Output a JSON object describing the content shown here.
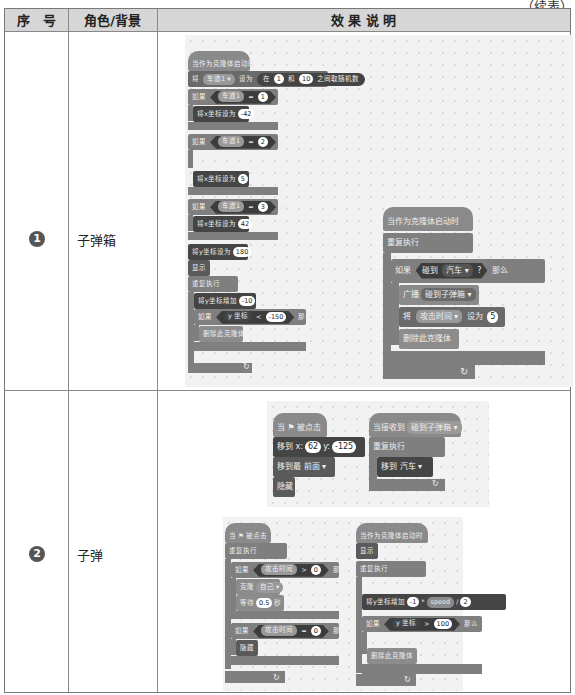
{
  "page": {
    "continued_label": "（续表）"
  },
  "table": {
    "headers": [
      "序　号",
      "角色/背景",
      "效 果 说 明"
    ],
    "rows": [
      {
        "number": "1",
        "role": "子弹箱",
        "scripts": [
          {
            "hat": "当作为克隆体启动时",
            "blocks": [
              {
                "text_parts": [
                  "将",
                  "车道1 ▾",
                  "设为",
                  "在",
                  "1",
                  "和",
                  "10",
                  "之间取随机数"
                ]
              },
              {
                "if": [
                  "如果",
                  "车道1",
                  "=",
                  "1",
                  "那么"
                ],
                "body": [
                  "将x坐标设为",
                  "-42"
                ]
              },
              {
                "if": [
                  "如果",
                  "车道1",
                  "=",
                  "2",
                  "那么"
                ],
                "body": [
                  "将x坐标设为",
                  "5"
                ]
              },
              {
                "if": [
                  "如果",
                  "车道1",
                  "=",
                  "3",
                  "那么"
                ],
                "body": [
                  "将x坐标设为",
                  "42"
                ]
              },
              {
                "text_parts": [
                  "将y坐标设为",
                  "180"
                ]
              },
              {
                "text_parts": [
                  "显示"
                ]
              },
              {
                "loop": "重复执行",
                "body": [
                  {
                    "text_parts": [
                      "将y坐标增加",
                      "-10"
                    ]
                  },
                  {
                    "if": [
                      "如果",
                      "y 坐标",
                      "<",
                      "-150",
                      "那么"
                    ],
                    "body": [
                      "删除此克隆体"
                    ]
                  }
                ]
              }
            ]
          },
          {
            "hat": "当作为克隆体启动时",
            "loop": "重复执行",
            "if": [
              "如果",
              "碰到",
              "汽车 ▾",
              "?",
              "那么"
            ],
            "body": [
              {
                "text_parts": [
                  "广播",
                  "碰到子弹箱 ▾"
                ]
              },
              {
                "text_parts": [
                  "将",
                  "攻击时间 ▾",
                  "设为",
                  "5"
                ]
              },
              {
                "text_parts": [
                  "删除此克隆体"
                ]
              }
            ]
          }
        ]
      },
      {
        "number": "2",
        "role": "子弹",
        "scripts": [
          {
            "hat": "当 ⚑ 被点击",
            "blocks": [
              {
                "text_parts": [
                  "移到 x:",
                  "62",
                  "y:",
                  "-125"
                ]
              },
              {
                "text_parts": [
                  "移到最",
                  "前面 ▾"
                ]
              },
              {
                "text_parts": [
                  "隐藏"
                ]
              }
            ]
          },
          {
            "hat": "当接收到",
            "hat_value": "碰到子弹箱 ▾",
            "loop": "重复执行",
            "body": [
              {
                "text_parts": [
                  "移到",
                  "汽车 ▾"
                ]
              }
            ]
          },
          {
            "hat": "当 ⚑ 被点击",
            "loop": "重复执行",
            "if1": [
              "如果",
              "攻击时间",
              ">",
              "0",
              "那么"
            ],
            "if1_body": [
              {
                "text_parts": [
                  "克隆",
                  "自己 ▾"
                ]
              },
              {
                "text_parts": [
                  "等待",
                  "0.5",
                  "秒"
                ]
              }
            ],
            "if2": [
              "如果",
              "攻击时间",
              "=",
              "0",
              "那么"
            ],
            "if2_body": [
              {
                "text_parts": [
                  "隐藏"
                ]
              }
            ]
          },
          {
            "hat": "当作为克隆体启动时",
            "blocks": [
              {
                "text_parts": [
                  "显示"
                ]
              }
            ],
            "loop": "重复执行",
            "body": [
              {
                "text_parts": [
                  "将y坐标增加",
                  "-1",
                  "*",
                  "speed",
                  "/",
                  "2"
                ]
              },
              {
                "if": [
                  "如果",
                  "y 坐标",
                  ">",
                  "100",
                  "那么"
                ],
                "body": [
                  "删除此克隆体"
                ]
              }
            ]
          }
        ]
      }
    ]
  },
  "colors": {
    "header_bg": "#d6d6d6",
    "border": "#888888",
    "panel_bg": "#f2f2f2",
    "block_dark": "#454545",
    "block_mid": "#7f7f7f"
  }
}
